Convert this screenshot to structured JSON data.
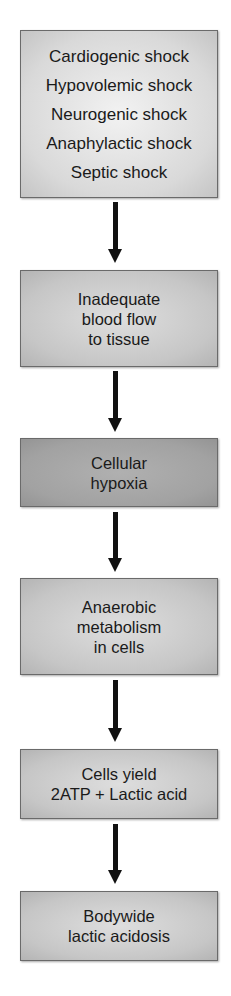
{
  "flowchart": {
    "nodes": [
      {
        "id": "causes",
        "lines": [
          "Cardiogenic shock",
          "Hypovolemic shock",
          "Neurogenic shock",
          "Anaphylactic shock",
          "Septic shock"
        ]
      },
      {
        "id": "inadequate-flow",
        "lines": [
          "Inadequate",
          "blood flow",
          "to tissue"
        ]
      },
      {
        "id": "hypoxia",
        "lines": [
          "Cellular",
          "hypoxia"
        ]
      },
      {
        "id": "anaerobic",
        "lines": [
          "Anaerobic",
          "metabolism",
          "in cells"
        ]
      },
      {
        "id": "yield",
        "lines": [
          "Cells yield",
          "2ATP + Lactic acid"
        ]
      },
      {
        "id": "acidosis",
        "lines": [
          "Bodywide",
          "lactic acidosis"
        ]
      }
    ],
    "edges": [
      {
        "from": "causes",
        "to": "inadequate-flow"
      },
      {
        "from": "inadequate-flow",
        "to": "hypoxia"
      },
      {
        "from": "hypoxia",
        "to": "anaerobic"
      },
      {
        "from": "anaerobic",
        "to": "yield"
      },
      {
        "from": "yield",
        "to": "acidosis"
      }
    ],
    "colors": {
      "box_light": "#d9d9d9",
      "box_dark": "#a2a2a2",
      "arrow": "#111111",
      "text": "#1a1a1a"
    }
  }
}
